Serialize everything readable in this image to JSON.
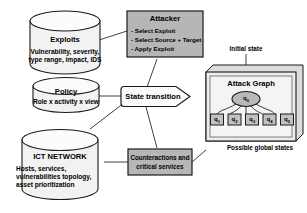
{
  "diagram": {
    "colors": {
      "shaded_fill": "#b6b6b6",
      "light_fill": "#f0f0f0",
      "node_fill": "#c9c9c9",
      "box_fill": "#ececec",
      "stroke": "#1a1a1a",
      "background": "#ffffff"
    },
    "datastores": [
      {
        "id": "exploits",
        "title": "Exploits",
        "lines": [
          "Vulnerability, severity,",
          "type range, impact, IDS"
        ]
      },
      {
        "id": "policy",
        "title": "Policy",
        "lines": [
          "Role x activity x view"
        ]
      },
      {
        "id": "ict-network",
        "title": "ICT NETWORK",
        "lines": [
          "Hosts, services,",
          "vulnerabilities topology,",
          "asset prioritization"
        ]
      }
    ],
    "attacker": {
      "title": "Attacker",
      "actions": [
        "- Select Exploit",
        "- Select Source + Target",
        "- Apply Exploit"
      ]
    },
    "state_transition": {
      "label": "State transition"
    },
    "counteractions": {
      "lines": [
        "Counteractions and",
        "critical services"
      ]
    },
    "attack_graph": {
      "panel_title": "Attack Graph",
      "initial_state_label": "Initial state",
      "possible_states_label": "Possible global states",
      "root_node": {
        "base": "q",
        "sub": "0"
      },
      "leaf_nodes": [
        {
          "base": "q",
          "sub": "1"
        },
        {
          "base": "q",
          "sub": "2"
        },
        {
          "base": "q",
          "sub": "3"
        },
        {
          "base": "q",
          "sub": "4"
        },
        {
          "base": "q",
          "sub": "5"
        }
      ]
    }
  }
}
